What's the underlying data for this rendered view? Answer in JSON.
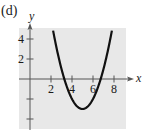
{
  "panel_label": "(d)",
  "colors": {
    "plot_background": "#e8e8e8",
    "axis": "#555555",
    "curve": "#111111"
  },
  "chart_data": {
    "type": "line",
    "title": "",
    "xlabel": "x",
    "ylabel": "y",
    "xlim": [
      -1,
      9
    ],
    "ylim": [
      -5,
      5
    ],
    "x_ticks": [
      2,
      4,
      6,
      8
    ],
    "x_tick_labels": [
      "2",
      "4",
      "6",
      "8"
    ],
    "y_ticks": [
      -4,
      -2,
      2,
      4
    ],
    "y_tick_labels": [
      "",
      "",
      "2",
      "4"
    ],
    "grid": false,
    "legend": null,
    "series": [
      {
        "name": "parabola",
        "equation": "y = (x - 5)^2 - 3",
        "vertex": [
          5,
          -3
        ],
        "x_intercepts": [
          3.27,
          6.73
        ],
        "x": [
          2.2,
          2.5,
          3,
          3.5,
          4,
          4.5,
          5,
          5.5,
          6,
          6.5,
          7,
          7.5,
          7.8
        ],
        "y": [
          4.84,
          3.25,
          1,
          -0.75,
          -2,
          -2.75,
          -3,
          -2.75,
          -2,
          -0.75,
          1,
          3.25,
          4.84
        ]
      }
    ]
  }
}
